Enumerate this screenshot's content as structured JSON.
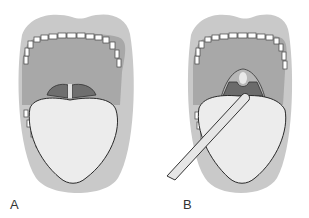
{
  "figure": {
    "panels": [
      {
        "id": "A",
        "label": "A",
        "description": "Open mouth, tongue at rest"
      },
      {
        "id": "B",
        "label": "B",
        "description": "Open mouth with tongue depressor pressing tongue, uvula and pharynx visible"
      }
    ]
  },
  "colors": {
    "lips": "#c8c8c8",
    "palate": "#a9a9a9",
    "tongue": "#ececec",
    "teeth": "#ffffff",
    "outline": "#2a2a2a",
    "throat": "#6f6f6f",
    "tonsil": "#7a7a7a",
    "depressor": "#e6e6e6"
  }
}
